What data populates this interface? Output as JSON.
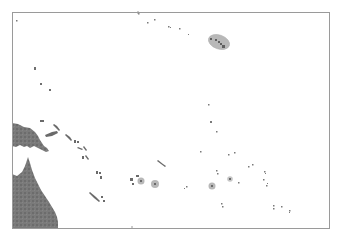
{
  "map": {
    "type": "locator-map",
    "region": "Pacific Ocean / Oceania",
    "width": 337,
    "height": 237,
    "frame": {
      "x": 12,
      "y": 12,
      "w": 318,
      "h": 217,
      "stroke": "#9a9a9a"
    },
    "colors": {
      "ocean": "#ffffff",
      "land": "#7a7a7a",
      "land_dark": "#5f5f5f",
      "island": "#6a6a6a",
      "highlight_fill": "#b8b8b8",
      "highlight_stroke": "#a0a0a0",
      "frame": "#9a9a9a"
    },
    "highlights": [
      {
        "name": "hawaii-highlight",
        "type": "ellipse",
        "cx": 219,
        "cy": 42,
        "rx": 11,
        "ry": 7,
        "rotate": 20
      },
      {
        "name": "atoll-highlight-1",
        "type": "circle",
        "cx": 141,
        "cy": 181,
        "r": 3.5
      },
      {
        "name": "atoll-highlight-2",
        "type": "circle",
        "cx": 155,
        "cy": 184,
        "r": 4
      },
      {
        "name": "atoll-highlight-3",
        "type": "circle",
        "cx": 212,
        "cy": 186,
        "r": 3.5
      },
      {
        "name": "atoll-highlight-4",
        "type": "circle",
        "cx": 230,
        "cy": 179,
        "r": 2.5
      }
    ],
    "landmasses": [
      "Australia (Queensland)",
      "New Guinea"
    ],
    "labels": []
  }
}
